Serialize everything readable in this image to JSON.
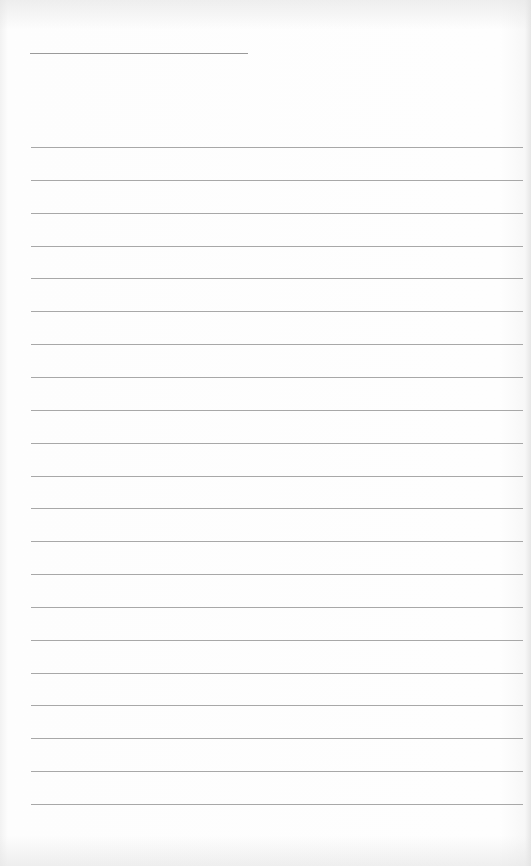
{
  "document": {
    "type": "lined-writing-sheet",
    "header_line": {
      "label": "",
      "value": ""
    },
    "ruled_line_count": 21,
    "lines": [
      "",
      "",
      "",
      "",
      "",
      "",
      "",
      "",
      "",
      "",
      "",
      "",
      "",
      "",
      "",
      "",
      "",
      "",
      "",
      "",
      ""
    ],
    "colors": {
      "paper": "#fdfdfd",
      "rule": "#a8a8a8"
    }
  }
}
